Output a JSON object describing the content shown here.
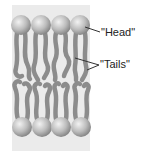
{
  "diagram": {
    "type": "phospholipid-bilayer",
    "labels": {
      "head": "\"Head\"",
      "tails": "\"Tails\""
    },
    "colors": {
      "panel": "#ebebeb",
      "tail": "#8c8c8c",
      "head_light": "#e6e6e6",
      "head_dark": "#8a8a8a",
      "leader": "#333333"
    },
    "top_heads": [
      {
        "cx": 21,
        "cy": 25
      },
      {
        "cx": 41,
        "cy": 25
      },
      {
        "cx": 61,
        "cy": 25
      },
      {
        "cx": 80,
        "cy": 25
      }
    ],
    "bottom_heads": [
      {
        "cx": 22,
        "cy": 127
      },
      {
        "cx": 42,
        "cy": 127
      },
      {
        "cx": 61,
        "cy": 127
      },
      {
        "cx": 81,
        "cy": 127
      }
    ]
  }
}
